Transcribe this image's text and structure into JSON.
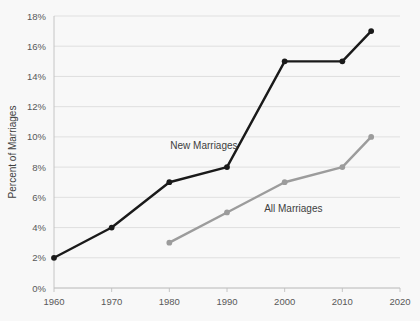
{
  "chart_data": {
    "type": "line",
    "title": "",
    "xlabel": "",
    "ylabel": "Percent of Marriages",
    "xlim": [
      1960,
      2020
    ],
    "ylim": [
      0,
      18
    ],
    "x_ticks": [
      "1960",
      "1970",
      "1980",
      "1990",
      "2000",
      "2010",
      "2020"
    ],
    "y_ticks": [
      "0%",
      "2%",
      "4%",
      "6%",
      "8%",
      "10%",
      "12%",
      "14%",
      "16%",
      "18%"
    ],
    "grid": true,
    "legend": "inline-labels",
    "series": [
      {
        "name": "New Marriages",
        "color": "#1a1a1a",
        "x": [
          1960,
          1970,
          1980,
          1990,
          2000,
          2010,
          2015
        ],
        "values": [
          2,
          4,
          7,
          8,
          15,
          15,
          17
        ],
        "label_x": 1986,
        "label_y": 9.2
      },
      {
        "name": "All Marriages",
        "color": "#9c9c9c",
        "x": [
          1980,
          1990,
          2000,
          2010,
          2015
        ],
        "values": [
          3,
          5,
          7,
          8,
          10
        ],
        "label_x": 2001.5,
        "label_y": 5.0
      }
    ]
  },
  "colors": {
    "background": "#f8f8f8",
    "gridline": "#d9d9d9",
    "axis": "#bfbfbf",
    "tick_text": "#595959",
    "title_text": "#404040",
    "series_new_marriages": "#1a1a1a",
    "series_all_marriages": "#9c9c9c"
  }
}
